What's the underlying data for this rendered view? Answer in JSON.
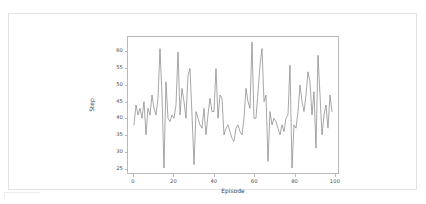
{
  "chart_data": {
    "type": "line",
    "title": "",
    "xlabel": "Episode",
    "ylabel": "Step",
    "xlim": [
      -3,
      102
    ],
    "ylim": [
      23.5,
      64.5
    ],
    "xticks": [
      0,
      20,
      40,
      60,
      80,
      100
    ],
    "yticks": [
      25,
      30,
      35,
      40,
      45,
      50,
      55,
      60
    ],
    "grid": false,
    "legend": null,
    "line_color": "#7f7f7f",
    "line_width": 0.7,
    "series": [
      {
        "name": "Step",
        "x": [
          0,
          1,
          2,
          3,
          4,
          5,
          6,
          7,
          8,
          9,
          10,
          11,
          12,
          13,
          14,
          15,
          16,
          17,
          18,
          19,
          20,
          21,
          22,
          23,
          24,
          25,
          26,
          27,
          28,
          29,
          30,
          31,
          32,
          33,
          34,
          35,
          36,
          37,
          38,
          39,
          40,
          41,
          42,
          43,
          44,
          45,
          46,
          47,
          48,
          49,
          50,
          51,
          52,
          53,
          54,
          55,
          56,
          57,
          58,
          59,
          60,
          61,
          62,
          63,
          64,
          65,
          66,
          67,
          68,
          69,
          70,
          71,
          72,
          73,
          74,
          75,
          76,
          77,
          78,
          79,
          80,
          81,
          82,
          83,
          84,
          85,
          86,
          87,
          88,
          89,
          90,
          91,
          92,
          93,
          94,
          95,
          96,
          97,
          98,
          99
        ],
        "values": [
          38,
          44,
          41,
          43,
          40,
          45,
          35,
          43,
          41,
          47,
          43,
          41,
          46,
          61,
          47,
          25,
          51,
          40,
          39,
          41,
          40,
          44,
          60,
          41,
          49,
          45,
          40,
          53,
          55,
          41,
          26,
          42,
          40,
          38,
          37,
          43,
          35,
          41,
          46,
          42,
          42,
          55,
          40,
          47,
          46,
          35,
          37,
          38,
          36,
          34,
          33,
          37,
          38,
          36,
          35,
          40,
          49,
          45,
          43,
          63,
          40,
          40,
          48,
          56,
          61,
          45,
          47,
          27,
          42,
          38,
          40,
          39,
          37,
          35,
          38,
          36,
          40,
          41,
          56,
          25,
          38,
          37,
          42,
          50,
          45,
          42,
          47,
          54,
          51,
          41,
          48,
          31,
          59,
          47,
          35,
          41,
          44,
          37,
          47,
          42
        ]
      }
    ]
  },
  "axis": {
    "x_tick_labels": [
      "0",
      "20",
      "40",
      "60",
      "80",
      "100"
    ],
    "y_tick_labels": [
      "25",
      "30",
      "35",
      "40",
      "45",
      "50",
      "55",
      "60"
    ],
    "x_axis_title": "Episode",
    "y_axis_title": "Step"
  }
}
